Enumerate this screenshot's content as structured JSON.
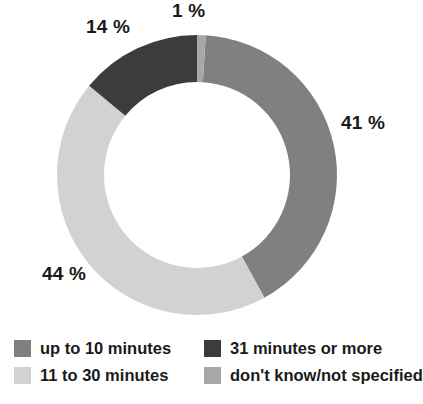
{
  "chart_data": {
    "type": "pie",
    "variant": "donut",
    "title": "",
    "subtitle": "",
    "xlabel": "",
    "ylabel": "",
    "grid": false,
    "legend_position": "bottom",
    "value_suffix": " %",
    "start_angle_deg": 0,
    "direction": "clockwise",
    "categories": [
      "up to 10 minutes",
      "11 to 30 minutes",
      "31 minutes or more",
      "don't know/not specified"
    ],
    "values": [
      41,
      44,
      14,
      1
    ],
    "value_labels": [
      "41 %",
      "44 %",
      "14 %",
      "1 %"
    ],
    "colors": [
      "#808080",
      "#d2d2d2",
      "#3c3c3c",
      "#a8a8a8"
    ],
    "slices": [
      {
        "label": "up to 10 minutes",
        "value": 41,
        "value_label": "41 %",
        "color": "#808080",
        "start_pct": 1,
        "end_pct": 42
      },
      {
        "label": "11 to 30 minutes",
        "value": 44,
        "value_label": "44 %",
        "color": "#d2d2d2",
        "start_pct": 42,
        "end_pct": 86
      },
      {
        "label": "31 minutes or more",
        "value": 14,
        "value_label": "14 %",
        "color": "#3c3c3c",
        "start_pct": 86,
        "end_pct": 100
      },
      {
        "label": "don't know/not specified",
        "value": 1,
        "value_label": "1 %",
        "color": "#a8a8a8",
        "start_pct": 0,
        "end_pct": 1
      }
    ]
  },
  "geometry": {
    "center_x": 197,
    "center_y": 175,
    "outer_radius": 140,
    "inner_radius": 93
  },
  "legend": {
    "items": [
      {
        "label": "up to 10 minutes",
        "color": "#808080"
      },
      {
        "label": "31 minutes or more",
        "color": "#3c3c3c"
      },
      {
        "label": "11 to 30 minutes",
        "color": "#d2d2d2"
      },
      {
        "label": "don't know/not specified",
        "color": "#a8a8a8"
      }
    ]
  },
  "footer": {
    "artifact_text": ""
  }
}
